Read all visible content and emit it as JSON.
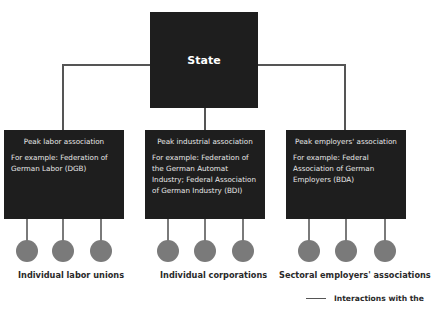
{
  "diagram": {
    "root": {
      "label": "State"
    },
    "associations": [
      {
        "title": "Peak labor association",
        "example": "For example: Federation of German Labor (DGB)",
        "members_label": "Individual labor unions",
        "member_count": 3
      },
      {
        "title": "Peak industrial association",
        "example": "For example: Federation of the German Automat Industry; Federal Association of German Industry (BDI)",
        "members_label": "Individual corporations",
        "member_count": 3
      },
      {
        "title": "Peak employers' association",
        "example": "For example: Federal Association of German Employers (BDA)",
        "members_label": "Sectoral employers' associations",
        "member_count": 3
      }
    ],
    "legend": {
      "label": "Interactions with the"
    },
    "colors": {
      "box_fill": "#1e1e1e",
      "box_text": "#e8e8e8",
      "node_fill": "#7a7a7a",
      "connector": "#555555",
      "label_text": "#2a2a2a"
    }
  }
}
